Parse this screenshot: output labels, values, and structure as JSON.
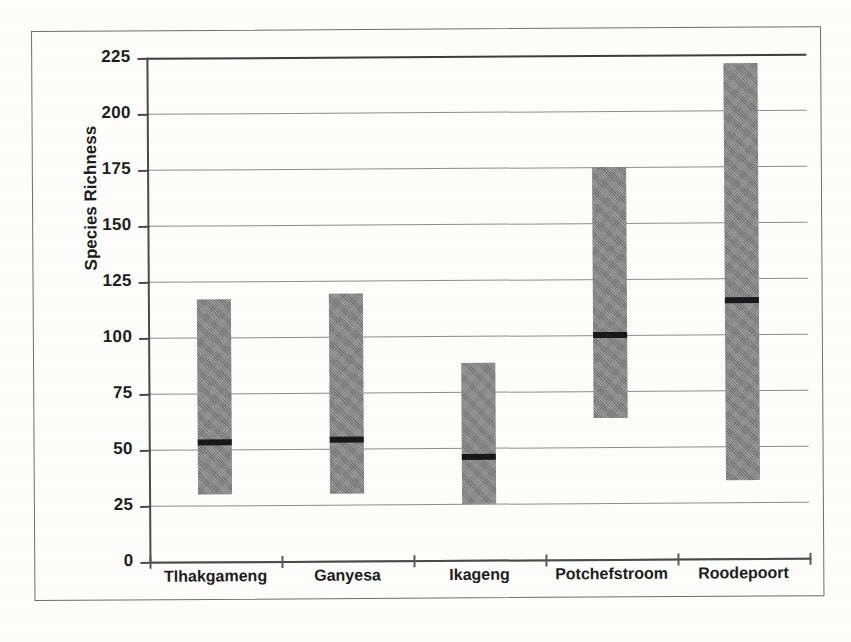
{
  "figure": {
    "background_color": "#fdfdfc",
    "frame_color": "#6f6f6f",
    "bar_color": "#838383",
    "median_color": "#18181a",
    "grid_color": "#8d8d8d",
    "axis_color": "#4a4a4a",
    "text_color": "#1d1d1d"
  },
  "chart_data": {
    "type": "bar",
    "subtype": "floating-range-bar",
    "title": "",
    "subtitle": "",
    "xlabel": "",
    "ylabel": "Species Richness",
    "categories": [
      "Tlhakgameng",
      "Ganyesa",
      "Ikageng",
      "Potchefstroom",
      "Roodepoort"
    ],
    "ylim": [
      0,
      225
    ],
    "ytick_labels": [
      "0",
      "25",
      "50",
      "75",
      "100",
      "125",
      "150",
      "175",
      "200",
      "225"
    ],
    "yticks": [
      0,
      25,
      50,
      75,
      100,
      125,
      150,
      175,
      200,
      225
    ],
    "grid": true,
    "legend": false,
    "series": [
      {
        "name": "Maximum",
        "values": [
          117,
          119,
          88,
          175,
          221
        ]
      },
      {
        "name": "Median",
        "values": [
          53,
          54,
          46,
          100,
          115
        ]
      },
      {
        "name": "Minimum",
        "values": [
          30,
          30,
          25,
          63,
          35
        ]
      }
    ],
    "bars": [
      {
        "category": "Tlhakgameng",
        "min": 30,
        "median": 53,
        "max": 117
      },
      {
        "category": "Ganyesa",
        "min": 30,
        "median": 54,
        "max": 119
      },
      {
        "category": "Ikageng",
        "min": 25,
        "median": 46,
        "max": 88
      },
      {
        "category": "Potchefstroom",
        "min": 63,
        "median": 100,
        "max": 175
      },
      {
        "category": "Roodepoort",
        "min": 35,
        "median": 115,
        "max": 221
      }
    ]
  }
}
